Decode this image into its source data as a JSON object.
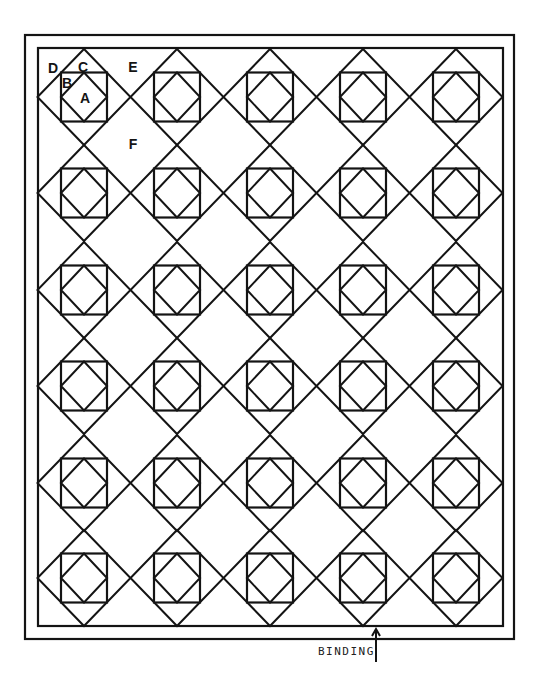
{
  "diagram": {
    "type": "quilt-layout",
    "layout": {
      "columns": 5,
      "rows": 6,
      "blocks_total": 30
    },
    "borders": {
      "outer": {
        "x1": 25,
        "y1": 35,
        "x2": 514,
        "y2": 639
      },
      "inner": {
        "x1": 38,
        "y1": 48,
        "x2": 503,
        "y2": 626
      }
    },
    "grid": {
      "column_centers": [
        84,
        177,
        270,
        363,
        456
      ],
      "row_centers": [
        97,
        193,
        290,
        386,
        483,
        578
      ],
      "diamond_half_width": 46.5,
      "diamond_half_height": 48,
      "square_half_width": 23,
      "square_half_height": 24.5
    },
    "piece_labels": [
      {
        "text": "D",
        "x": 53,
        "y": 73,
        "meaning": "corner triangle"
      },
      {
        "text": "C",
        "x": 83,
        "y": 72,
        "meaning": "side triangle"
      },
      {
        "text": "E",
        "x": 133,
        "y": 72,
        "meaning": "setting triangle"
      },
      {
        "text": "B",
        "x": 67,
        "y": 88,
        "meaning": "small corner triangle"
      },
      {
        "text": "A",
        "x": 85,
        "y": 103,
        "meaning": "center square"
      },
      {
        "text": "F",
        "x": 133,
        "y": 149,
        "meaning": "setting square"
      }
    ],
    "annotation": {
      "label": "BINDING",
      "arrow": {
        "x": 376,
        "y_from": 662,
        "y_to": 629
      }
    },
    "colors": {
      "line": "#141414",
      "background": "#ffffff"
    }
  }
}
